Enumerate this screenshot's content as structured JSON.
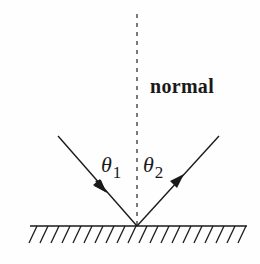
{
  "diagram": {
    "normal_label": "normal",
    "angles": [
      {
        "symbol": "θ",
        "subscript": "1",
        "meaning": "angle of incidence"
      },
      {
        "symbol": "θ",
        "subscript": "2",
        "meaning": "angle of reflection"
      }
    ],
    "colors": {
      "stroke": "#1a1a1a",
      "background": "#fefefe"
    }
  }
}
